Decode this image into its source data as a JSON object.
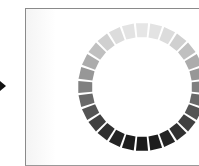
{
  "figure": {
    "pointer_icon": "right-arrow",
    "ring": {
      "segments": 28,
      "center": [
        142,
        87
      ],
      "outer_radius": 64,
      "inner_radius": 50,
      "lightest_color": "#e6e6e6",
      "darkest_color": "#1a1a1a",
      "gradient": "light at top to dark at bottom"
    }
  }
}
